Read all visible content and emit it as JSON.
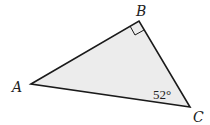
{
  "diagram": {
    "type": "right-triangle",
    "fill_color": "#ececec",
    "stroke_color": "#1a1a1a",
    "vertices": {
      "A": {
        "label": "A",
        "x": 31,
        "y": 84
      },
      "B": {
        "label": "B",
        "x": 139,
        "y": 21
      },
      "C": {
        "label": "C",
        "x": 190,
        "y": 107
      }
    },
    "right_angle_at": "B",
    "angle_C": {
      "label": "52°",
      "value": 52,
      "unit": "degrees"
    }
  }
}
